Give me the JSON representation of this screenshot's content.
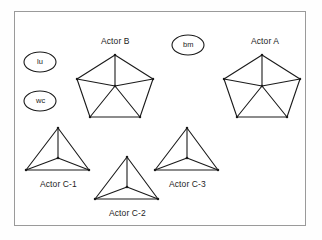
{
  "diagram": {
    "frame": {
      "x": 14,
      "y": 11,
      "width": 292,
      "height": 215,
      "border_color": "#9a9a9a",
      "fill": "#ffffff"
    },
    "stroke_color": "#1a1a1a",
    "text_color": "#1c1c1c",
    "background": "#ffffff",
    "ellipses": [
      {
        "id": "lu",
        "label": "lu",
        "cx": 40,
        "cy": 62,
        "rx": 16,
        "ry": 10
      },
      {
        "id": "wc",
        "label": "wc",
        "cx": 40,
        "cy": 101,
        "rx": 16,
        "ry": 10
      },
      {
        "id": "bm",
        "label": "bm",
        "cx": 188,
        "cy": 45,
        "rx": 16,
        "ry": 10
      }
    ],
    "shapes": [
      {
        "id": "actor-b",
        "label": "Actor B",
        "type": "pentagon-wheel",
        "label_x": 115,
        "label_y": 41,
        "hub": {
          "x": 115,
          "y": 86
        },
        "vertices": [
          {
            "x": 115,
            "y": 55
          },
          {
            "x": 153,
            "y": 79
          },
          {
            "x": 140,
            "y": 117
          },
          {
            "x": 90,
            "y": 117
          },
          {
            "x": 77,
            "y": 79
          }
        ]
      },
      {
        "id": "actor-a",
        "label": "Actor A",
        "type": "pentagon-wheel",
        "label_x": 265,
        "label_y": 41,
        "hub": {
          "x": 262,
          "y": 86
        },
        "vertices": [
          {
            "x": 262,
            "y": 55
          },
          {
            "x": 300,
            "y": 79
          },
          {
            "x": 287,
            "y": 117
          },
          {
            "x": 237,
            "y": 117
          },
          {
            "x": 224,
            "y": 79
          }
        ]
      },
      {
        "id": "actor-c-1",
        "label": "Actor C-1",
        "type": "triangle-wheel",
        "label_x": 58,
        "label_y": 184,
        "hub": {
          "x": 58,
          "y": 158
        },
        "vertices": [
          {
            "x": 58,
            "y": 128
          },
          {
            "x": 89,
            "y": 170
          },
          {
            "x": 26,
            "y": 170
          }
        ]
      },
      {
        "id": "actor-c-2",
        "label": "Actor C-2",
        "type": "triangle-wheel",
        "label_x": 127,
        "label_y": 213,
        "hub": {
          "x": 127,
          "y": 187
        },
        "vertices": [
          {
            "x": 127,
            "y": 157
          },
          {
            "x": 158,
            "y": 199
          },
          {
            "x": 95,
            "y": 199
          }
        ]
      },
      {
        "id": "actor-c-3",
        "label": "Actor C-3",
        "type": "triangle-wheel",
        "label_x": 187,
        "label_y": 184,
        "hub": {
          "x": 187,
          "y": 158
        },
        "vertices": [
          {
            "x": 187,
            "y": 128
          },
          {
            "x": 218,
            "y": 170
          },
          {
            "x": 155,
            "y": 170
          }
        ]
      }
    ]
  }
}
